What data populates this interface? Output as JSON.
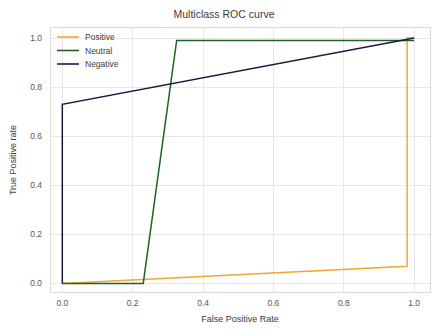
{
  "chart_data": {
    "type": "line",
    "title": "Multiclass ROC curve",
    "xlabel": "False Positive Rate",
    "ylabel": "True Positive rate",
    "xlim": [
      -0.035,
      1.045
    ],
    "ylim": [
      -0.035,
      1.045
    ],
    "grid": true,
    "legend_position": "upper left",
    "xticks": [
      0.0,
      0.2,
      0.4,
      0.6,
      0.8,
      1.0
    ],
    "yticks": [
      0.0,
      0.2,
      0.4,
      0.6,
      0.8,
      1.0
    ],
    "xticklabels": [
      "0.0",
      "0.2",
      "0.4",
      "0.6",
      "0.8",
      "1.0"
    ],
    "yticklabels": [
      "0.0",
      "0.2",
      "0.4",
      "0.6",
      "0.8",
      "1.0"
    ],
    "series": [
      {
        "name": "Positive",
        "color": "#f0a830",
        "x": [
          0.0,
          0.98,
          0.98,
          1.0
        ],
        "y": [
          0.0,
          0.07,
          1.0,
          1.0
        ]
      },
      {
        "name": "Neutral",
        "color": "#1d6421",
        "x": [
          0.0,
          0.23,
          0.325,
          1.0
        ],
        "y": [
          0.0,
          0.0,
          0.99,
          0.99
        ]
      },
      {
        "name": "Negative",
        "color": "#191945",
        "x": [
          0.0,
          0.0,
          1.0
        ],
        "y": [
          0.0,
          0.73,
          1.0
        ]
      }
    ]
  },
  "legend": {
    "items": [
      {
        "label": "Positive",
        "color": "#f0a830"
      },
      {
        "label": "Neutral",
        "color": "#1d6421"
      },
      {
        "label": "Negative",
        "color": "#191945"
      }
    ]
  },
  "colors": {
    "background": "#ffffff",
    "grid": "#e2e2e2",
    "frame": "#d6d6d6",
    "text": "#3b3b3b",
    "tick_text": "#555555"
  }
}
